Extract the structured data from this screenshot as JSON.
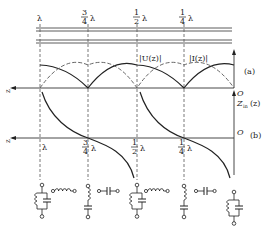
{
  "diagram": {
    "positions": [
      {
        "label": "λ",
        "num": "",
        "den": "",
        "x": 40
      },
      {
        "label": "λ",
        "num": "3",
        "den": "4",
        "x": 88
      },
      {
        "label": "λ",
        "num": "1",
        "den": "2",
        "x": 137
      },
      {
        "label": "λ",
        "num": "1",
        "den": "4",
        "x": 184
      }
    ],
    "panel_a": {
      "tag": "(a)",
      "origin": "O",
      "voltage_label": "|U(z)|",
      "current_label": "|I(z)|",
      "z_axis": "z"
    },
    "panel_b": {
      "tag": "(b)",
      "origin": "O",
      "impedance_label": "Z",
      "impedance_sub": "in",
      "impedance_arg": "(z)",
      "z_axis": "z"
    },
    "circuits": [
      {
        "type": "parallel-LC",
        "position": "λ"
      },
      {
        "type": "series-inductor",
        "position": "between λ and 3/4λ"
      },
      {
        "type": "series-LC",
        "position": "3/4λ"
      },
      {
        "type": "series-capacitor",
        "position": "between 3/4λ and 1/2λ"
      },
      {
        "type": "parallel-LC",
        "position": "1/2λ"
      },
      {
        "type": "series-inductor",
        "position": "between 1/2λ and 1/4λ"
      },
      {
        "type": "series-LC",
        "position": "1/4λ"
      },
      {
        "type": "series-capacitor",
        "position": "between 1/4λ and 0"
      },
      {
        "type": "parallel-LC",
        "position": "0"
      }
    ],
    "colors": {
      "line": "#222222",
      "dashed": "#555555"
    }
  }
}
